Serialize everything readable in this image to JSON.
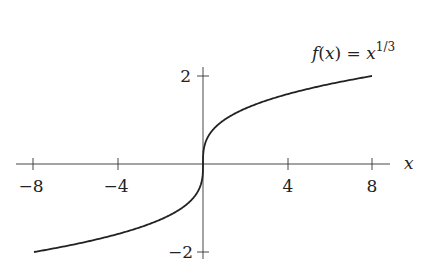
{
  "chart_data": {
    "type": "line",
    "title": "",
    "annotation": "f(x) = x^{1/3}",
    "xlabel": "x",
    "ylabel": "",
    "xlim": [
      -8,
      8
    ],
    "ylim": [
      -2,
      2
    ],
    "x_ticks": [
      -8,
      -4,
      4,
      8
    ],
    "y_ticks": [
      2,
      -2
    ],
    "x_tick_labels": [
      "−8",
      "−4",
      "4",
      "8"
    ],
    "y_tick_labels": [
      "2",
      "−2"
    ],
    "grid": false,
    "legend": "none",
    "series": [
      {
        "name": "f(x) = x^{1/3}",
        "x": [
          -8,
          -6,
          -4,
          -2,
          -1,
          -0.5,
          -0.1,
          0,
          0.1,
          0.5,
          1,
          2,
          4,
          6,
          8
        ],
        "y": [
          -2,
          -1.817,
          -1.587,
          -1.26,
          -1,
          -0.794,
          -0.464,
          0,
          0.464,
          0.794,
          1,
          1.26,
          1.587,
          1.817,
          2
        ]
      }
    ]
  },
  "labels": {
    "func_f": "f",
    "func_paren_open": "(",
    "func_x": "x",
    "func_paren_close": ")",
    "func_eq": " = ",
    "func_base": "x",
    "func_exp": "1/3",
    "x_axis": "x",
    "xt0": "−8",
    "xt1": "−4",
    "xt2": "4",
    "xt3": "8",
    "yt_top": "2",
    "yt_bottom": "−2"
  }
}
